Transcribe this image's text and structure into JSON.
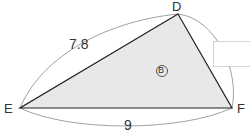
{
  "figure": {
    "vertices": {
      "D": "D",
      "E": "E",
      "F": "F"
    },
    "side_labels": {
      "ED": "7.8",
      "EF": "9"
    },
    "region_label": "B",
    "fill_color": "#e8e8e8",
    "stroke_color": "#222222"
  },
  "answer_box": {
    "value": ""
  }
}
